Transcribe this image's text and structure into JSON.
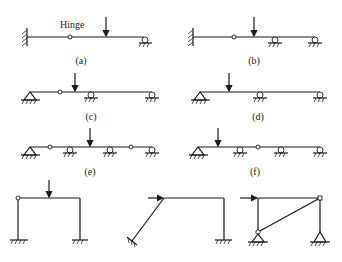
{
  "figure": {
    "annotation_hinge": "Hinge",
    "labels": {
      "a": "(a)",
      "b": "(b)",
      "c": "(c)",
      "d": "(d)",
      "e": "(e)",
      "f": "(f)"
    },
    "colors": {
      "line": "#1a1a1a",
      "background": "#ffffff"
    },
    "structures": [
      {
        "id": "a",
        "type": "beam",
        "supports": [
          "fixed-left",
          "roller-right"
        ],
        "hinges": 1,
        "load": "vertical point load"
      },
      {
        "id": "b",
        "type": "beam",
        "supports": [
          "fixed-left",
          "roller",
          "roller-right"
        ],
        "hinges": 1,
        "load": "vertical point load"
      },
      {
        "id": "c",
        "type": "beam",
        "supports": [
          "pin-left",
          "roller",
          "roller-right"
        ],
        "hinges": 1,
        "load": "vertical point load"
      },
      {
        "id": "d",
        "type": "beam",
        "supports": [
          "pin-left",
          "roller",
          "roller-right"
        ],
        "hinges": 0,
        "load": "vertical point load"
      },
      {
        "id": "e",
        "type": "beam",
        "supports": [
          "pin-left",
          "roller",
          "roller",
          "roller-right"
        ],
        "hinges": 2,
        "load": "vertical point load"
      },
      {
        "id": "f",
        "type": "beam",
        "supports": [
          "pin-left",
          "roller",
          "roller",
          "roller-right"
        ],
        "hinges": 1,
        "load": "vertical point load"
      },
      {
        "id": "g",
        "type": "frame",
        "supports": [
          "fixed",
          "fixed"
        ],
        "hinges": 1,
        "load": "vertical point load"
      },
      {
        "id": "h",
        "type": "frame",
        "supports": [
          "fixed-inclined",
          "fixed"
        ],
        "hinges": 0,
        "load": "horizontal point load"
      },
      {
        "id": "i",
        "type": "frame",
        "supports": [
          "pin",
          "pin"
        ],
        "hinges": 2,
        "load": "horizontal point load",
        "diagonal": true
      }
    ]
  }
}
